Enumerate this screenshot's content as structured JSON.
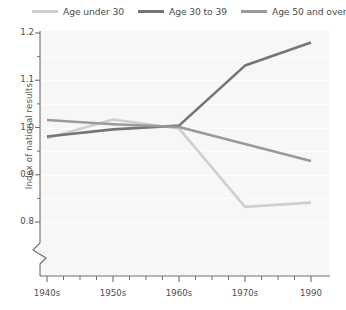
{
  "chart_data": {
    "type": "line",
    "title": "",
    "subtitle": "",
    "xlabel": "",
    "ylabel": "Index of national results",
    "grid": true,
    "legend_position": "top",
    "x_categories": [
      "1940s",
      "1950s",
      "1960s",
      "1970s",
      "1990"
    ],
    "x_tick_labels": [
      "1940s",
      "1950s",
      "1960s",
      "1970s",
      "1990"
    ],
    "y_tick_labels": [
      "1.2",
      "1.1",
      "1.0",
      "0.9",
      "0.8"
    ],
    "y_tick_values": [
      1.2,
      1.1,
      1.0,
      0.9,
      0.8
    ],
    "y_minor_ticks": [
      1.15,
      1.05,
      0.95,
      0.85
    ],
    "ylim": [
      0.78,
      1.21
    ],
    "axis_break": true,
    "axis_break_note": "y-axis broken below 0.8",
    "series": [
      {
        "name": "Age under 30",
        "color": "#cfcfcf",
        "x": [
          "1940s",
          "1950s",
          "1960s",
          "1970s",
          "1990"
        ],
        "values": [
          0.977,
          1.017,
          0.998,
          0.832,
          0.841
        ]
      },
      {
        "name": "Age 30 to 39",
        "color": "#757575",
        "x": [
          "1940s",
          "1950s",
          "1960s",
          "1970s",
          "1990"
        ],
        "values": [
          0.981,
          0.996,
          1.004,
          1.131,
          1.18
        ]
      },
      {
        "name": "Age 50 and over",
        "color": "#9a9a9a",
        "x": [
          "1940s",
          "1950s",
          "1960s",
          "1970s",
          "1990"
        ],
        "values": [
          1.016,
          1.007,
          1.001,
          0.965,
          0.929
        ]
      }
    ]
  },
  "legend": {
    "items": [
      {
        "label": "Age under 30",
        "color": "#cfcfcf"
      },
      {
        "label": "Age 30 to 39",
        "color": "#757575"
      },
      {
        "label": "Age 50 and over",
        "color": "#9a9a9a"
      }
    ]
  },
  "axes": {
    "y_title": "Index of national results",
    "y_labels": [
      "1.2",
      "1.1",
      "1.0",
      "0.9",
      "0.8"
    ],
    "x_labels": [
      "1940s",
      "1950s",
      "1960s",
      "1970s",
      "1990"
    ]
  },
  "colors": {
    "plot_background": "#f7f7f7",
    "axis": "#6e6e6e",
    "text": "#4d4d4d",
    "gridline": "#fdfdfd"
  }
}
